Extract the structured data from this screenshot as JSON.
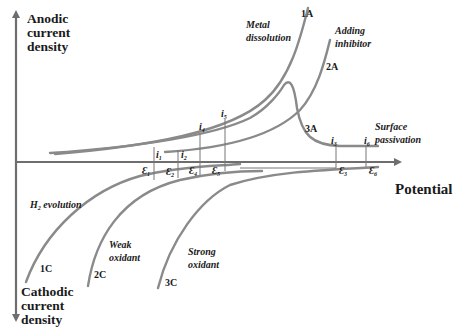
{
  "axes": {
    "y_top_label": [
      "Anodic",
      "current",
      "density"
    ],
    "y_bottom_label": [
      "Cathodic",
      "current",
      "density"
    ],
    "x_label": "Potential"
  },
  "curves": {
    "anodic": [
      {
        "id": "1A",
        "annotation": [
          "Metal",
          "dissolution"
        ]
      },
      {
        "id": "2A",
        "annotation": [
          "Adding",
          "inhibitor"
        ]
      },
      {
        "id": "3A",
        "annotation": [
          "Surface",
          "passivation"
        ]
      }
    ],
    "cathodic": [
      {
        "id": "1C",
        "annotation": [
          "H",
          "2",
          " evolution"
        ]
      },
      {
        "id": "2C",
        "annotation": [
          "Weak",
          "oxidant"
        ]
      },
      {
        "id": "3C",
        "annotation": [
          "Strong",
          "oxidant"
        ]
      }
    ]
  },
  "intersections": {
    "currents": [
      {
        "sym": "i",
        "sub": "1"
      },
      {
        "sym": "i",
        "sub": "2"
      },
      {
        "sym": "i",
        "sub": "3"
      },
      {
        "sym": "i",
        "sub": "4"
      },
      {
        "sym": "i",
        "sub": "5"
      },
      {
        "sym": "i",
        "sub": "6"
      }
    ],
    "potentials": [
      {
        "sym": "Ɛ",
        "sub": "1"
      },
      {
        "sym": "Ɛ",
        "sub": "2"
      },
      {
        "sym": "Ɛ",
        "sub": "3"
      },
      {
        "sym": "Ɛ",
        "sub": "4"
      },
      {
        "sym": "Ɛ",
        "sub": "5"
      },
      {
        "sym": "Ɛ",
        "sub": "6"
      }
    ]
  },
  "colors": {
    "curve": "#8a8a8a",
    "axis": "#6e6e6e",
    "text": "#1a1a1a"
  }
}
